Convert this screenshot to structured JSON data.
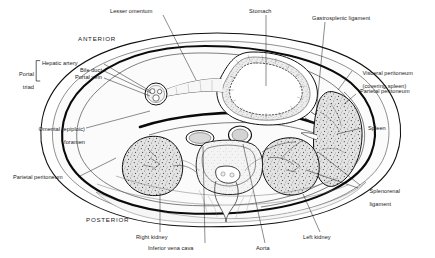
{
  "figure": {
    "orientation": {
      "anterior": "ANTERIOR",
      "posterior": "POSTERIOR"
    },
    "portal_triad": {
      "group_label_line1": "Portal",
      "group_label_line2": "triad",
      "members": [
        "Hepatic artery",
        "Bile duct",
        "Portal vein"
      ]
    },
    "labels": {
      "lesser_omentum": "Lesser omentum",
      "stomach": "Stomach",
      "gastrosplenic_ligament": "Gastrosplenic ligament",
      "visceral_peritoneum_line1": "Visceral peritoneum",
      "visceral_peritoneum_line2": "(covering spleen)",
      "parietal_peritoneum_right": "Parietal peritoneum",
      "spleen": "Spleen",
      "splenorenal_line1": "Splenorenal",
      "splenorenal_line2": "ligament",
      "left_kidney": "Left kidney",
      "aorta": "Aorta",
      "inferior_vena_cava": "Inferior vena cava",
      "right_kidney": "Right kidney",
      "parietal_peritoneum_left": "Parietal peritoneum",
      "omental_foramen_line1": "Omental (epiploic)",
      "omental_foramen_line2": "foramen"
    },
    "colors": {
      "ink": "#1a1a1a",
      "line": "#000000",
      "tissue_fill": "#f2f2f2",
      "organ_fill": "#dcdcdc",
      "paper": "#ffffff"
    }
  }
}
